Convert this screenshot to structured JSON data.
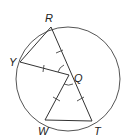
{
  "figure": {
    "type": "circle-geometry",
    "center": "Q",
    "points": [
      {
        "id": "R",
        "label": "R",
        "on_circle": true
      },
      {
        "id": "Y",
        "label": "Y",
        "on_circle": true
      },
      {
        "id": "Q",
        "label": "Q",
        "on_circle": false
      },
      {
        "id": "W",
        "label": "W",
        "on_circle": true
      },
      {
        "id": "T",
        "label": "T",
        "on_circle": true
      }
    ],
    "segments": [
      {
        "from": "R",
        "to": "Y"
      },
      {
        "from": "Y",
        "to": "Q"
      },
      {
        "from": "R",
        "to": "T",
        "through": "Q"
      },
      {
        "from": "Q",
        "to": "W"
      },
      {
        "from": "W",
        "to": "T"
      }
    ],
    "congruence_marks": {
      "single_tick_segments": [
        "RQ",
        "YQ",
        "QW",
        "QT"
      ],
      "congruent_angles": [
        "RQY",
        "WQT"
      ]
    }
  }
}
